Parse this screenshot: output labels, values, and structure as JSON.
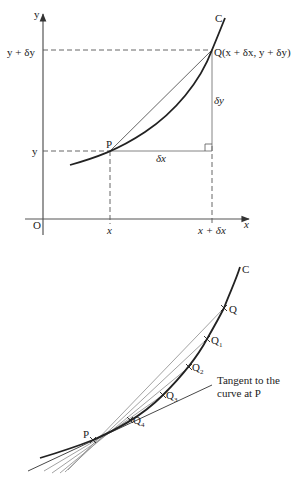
{
  "diagram_top": {
    "axis_labels": {
      "y": "y",
      "x": "x",
      "origin": "O"
    },
    "curve_label": "C",
    "point_p": "P",
    "point_q": "Q(x + δx, y + δy)",
    "y_ticks": {
      "lower": "y",
      "upper": "y + δy"
    },
    "x_ticks": {
      "lower": "x",
      "upper": "x + δx"
    },
    "increments": {
      "dx": "δx",
      "dy": "δy"
    }
  },
  "diagram_bottom": {
    "curve_label": "C",
    "point_p": "P",
    "points_q": [
      "Q",
      "Q1",
      "Q2",
      "Q3",
      "Q4"
    ],
    "q_labels": [
      {
        "main": "Q",
        "sub": ""
      },
      {
        "main": "Q",
        "sub": "1"
      },
      {
        "main": "Q",
        "sub": "2"
      },
      {
        "main": "Q",
        "sub": "3"
      },
      {
        "main": "Q",
        "sub": "4"
      }
    ],
    "tangent_label_line1": "Tangent to the",
    "tangent_label_line2": "curve at P"
  }
}
